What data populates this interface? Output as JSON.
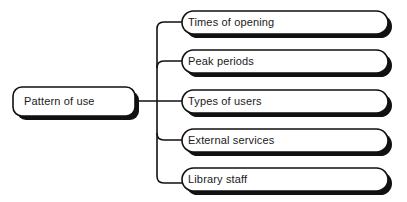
{
  "diagram": {
    "type": "mind-map-tree",
    "orientation": "left-to-right",
    "background_color": "#ffffff",
    "stroke_color": "#111111",
    "shadow_color": "#111111",
    "text_color": "#1a1a1a",
    "root": {
      "label": "Pattern of use",
      "shape": "rounded-rectangle",
      "x": 13,
      "y": 87,
      "width": 122,
      "height": 29
    },
    "spine": {
      "x": 157,
      "top": 22,
      "bottom": 183
    },
    "children": [
      {
        "label": "Times of opening",
        "shape": "rounded-rectangle",
        "x": 182,
        "y": 11,
        "width": 206,
        "height": 23,
        "branch_y": 22
      },
      {
        "label": "Peak periods",
        "shape": "rounded-rectangle",
        "x": 182,
        "y": 50,
        "width": 206,
        "height": 23,
        "branch_y": 61
      },
      {
        "label": "Types of users",
        "shape": "rounded-rectangle",
        "x": 182,
        "y": 90,
        "width": 206,
        "height": 23,
        "branch_y": 101
      },
      {
        "label": "External services",
        "shape": "rounded-rectangle",
        "x": 182,
        "y": 129,
        "width": 206,
        "height": 23,
        "branch_y": 140
      },
      {
        "label": "Library staff",
        "shape": "rounded-rectangle",
        "x": 182,
        "y": 168,
        "width": 206,
        "height": 23,
        "branch_y": 183
      }
    ]
  }
}
